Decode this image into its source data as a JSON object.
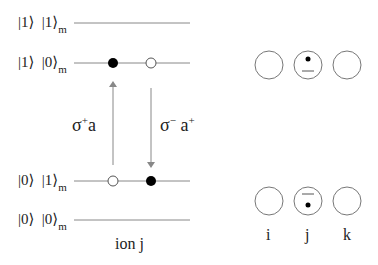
{
  "levels": [
    {
      "ket_ion": "|1⟩",
      "ket_mode": "|1⟩",
      "mode_sub": "m"
    },
    {
      "ket_ion": "|1⟩",
      "ket_mode": "|0⟩",
      "mode_sub": "m"
    },
    {
      "ket_ion": "|0⟩",
      "ket_mode": "|1⟩",
      "mode_sub": "m"
    },
    {
      "ket_ion": "|0⟩",
      "ket_mode": "|0⟩",
      "mode_sub": "m"
    }
  ],
  "transitions": {
    "up": {
      "sigma": "σ",
      "sup": "+",
      "op": "a"
    },
    "down": {
      "sigma": "σ",
      "sup_sigma": "−",
      "op": "a",
      "sup_op": "+"
    }
  },
  "ion_label": "ion j",
  "ions": {
    "labels": [
      "i",
      "j",
      "k"
    ]
  },
  "colors": {
    "line": "#888888",
    "dot": "#000000",
    "text": "#222222"
  }
}
